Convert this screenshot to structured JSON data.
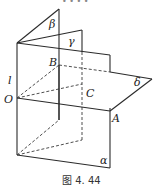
{
  "figure": {
    "caption": "图 4. 44",
    "partial_top_text": "• • • •",
    "labels": {
      "beta": "β",
      "gamma": "γ",
      "delta": "δ",
      "alpha": "α",
      "l": "l",
      "O": "O",
      "A": "A",
      "B": "B",
      "C": "C"
    }
  }
}
